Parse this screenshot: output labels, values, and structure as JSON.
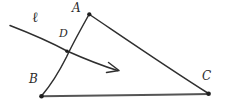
{
  "diagram": {
    "kind": "hand-drawn-geometry-sketch",
    "background_color": "#ffffff",
    "stroke_color": "#2f2f2f",
    "base_stroke_color": "#555555",
    "labels": {
      "vertex_a": "A",
      "vertex_b": "B",
      "vertex_c": "C",
      "point_d": "D",
      "line_l": "ℓ"
    },
    "points": {
      "A": {
        "x": 89,
        "y": 14
      },
      "B": {
        "x": 41,
        "y": 96
      },
      "C": {
        "x": 209,
        "y": 94
      },
      "D": {
        "x": 67,
        "y": 51
      }
    },
    "segments": [
      {
        "name": "side-AB",
        "from": "A",
        "to": "B"
      },
      {
        "name": "side-AC",
        "from": "A",
        "to": "C"
      },
      {
        "name": "side-BC",
        "from": "B",
        "to": "C"
      }
    ],
    "ray": {
      "name": "line-l",
      "start": {
        "x": 10,
        "y": 26
      },
      "end": {
        "x": 119,
        "y": 70
      },
      "has_arrowhead": true,
      "passes_through": "D"
    }
  }
}
